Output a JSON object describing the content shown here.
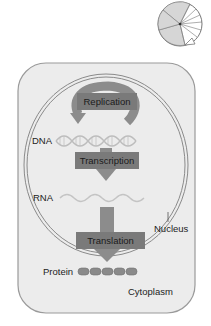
{
  "diagram": {
    "title_icon": "cell-cycle-pie-icon",
    "processes": [
      {
        "label": "Replication"
      },
      {
        "label": "Transcription"
      },
      {
        "label": "Translation"
      }
    ],
    "molecules": {
      "dna": "DNA",
      "rna": "RNA",
      "protein": "Protein"
    },
    "compartments": {
      "nucleus": "Nucleus",
      "cytoplasm": "Cytoplasm"
    },
    "colors": {
      "cell_fill": "#ececec",
      "cell_border": "#9a9a9a",
      "process_box": "#7a7a7a",
      "arrow": "#8c8c8c",
      "helix": "#c8c8c8",
      "bead": "#8a8a8a"
    }
  }
}
